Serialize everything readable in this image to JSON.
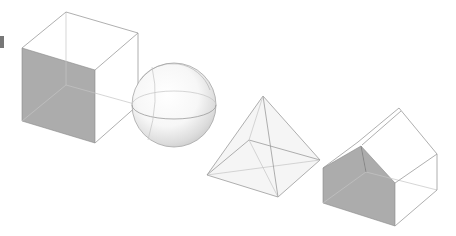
{
  "figure": {
    "title": "",
    "colors": {
      "background": "#ffffff",
      "edge": "#9a9a9a",
      "hidden_edge": "#c4c4c4",
      "shaded_face": "#acacac"
    },
    "shapes": [
      {
        "name": "cube",
        "label": "Cube",
        "shaded_face": "front-left"
      },
      {
        "name": "sphere",
        "label": "Sphere",
        "shaded_face": "none"
      },
      {
        "name": "pyramid",
        "label": "Square pyramid",
        "shaded_face": "none"
      },
      {
        "name": "house",
        "label": "House prism",
        "shaded_face": "front gable"
      }
    ]
  }
}
